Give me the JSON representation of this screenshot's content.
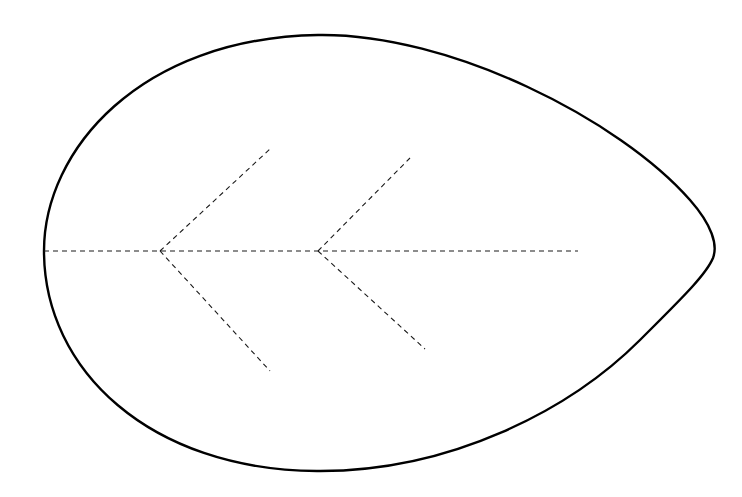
{
  "diagram": {
    "background_color": "#ffffff",
    "outline": {
      "color": "#000000",
      "stroke_width": 2.4,
      "left_x": 44,
      "right_tip": [
        713,
        256
      ],
      "top": [
        318,
        35
      ],
      "bottom": [
        317,
        471
      ]
    },
    "veins": {
      "color": "#1a1a1a",
      "style": "dashed",
      "midrib": {
        "from": [
          44,
          251
        ],
        "to": [
          578,
          251
        ]
      },
      "branches": [
        {
          "junction": [
            160,
            251
          ],
          "upper_tip": [
            270,
            149
          ],
          "lower_tip": [
            270,
            371
          ]
        },
        {
          "junction": [
            318,
            251
          ],
          "upper_tip": [
            410,
            158
          ],
          "lower_tip": [
            425,
            349
          ]
        }
      ]
    },
    "labels": []
  }
}
